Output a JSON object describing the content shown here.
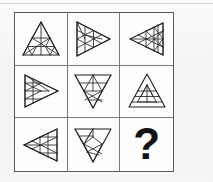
{
  "puzzle": {
    "type": "matrix-reasoning",
    "rows": 3,
    "columns": 3,
    "title": "Triangle pattern matrix",
    "missing_cell": "row-3-col-3",
    "missing_marker": "?",
    "stroke_color": "#1d1d1d",
    "grid_border_color": "#5a5a5a",
    "background_color": "#f7f7f7",
    "cells": [
      {
        "id": "cell-r1c1",
        "position": "row-1-col-1",
        "shape": "triangle",
        "orientation": "up",
        "description": "Upward triangle with internal lines",
        "content_label": "triangle-up-pattern-1"
      },
      {
        "id": "cell-r1c2",
        "position": "row-1-col-2",
        "shape": "triangle",
        "orientation": "right",
        "description": "Right-pointing triangle with internal lines",
        "content_label": "triangle-right-pattern-1"
      },
      {
        "id": "cell-r1c3",
        "position": "row-1-col-3",
        "shape": "triangle",
        "orientation": "left",
        "description": "Left-pointing triangle with internal lines",
        "content_label": "triangle-left-pattern-1"
      },
      {
        "id": "cell-r2c1",
        "position": "row-2-col-1",
        "shape": "triangle",
        "orientation": "right",
        "description": "Right-pointing triangle with internal lines",
        "content_label": "triangle-right-pattern-2"
      },
      {
        "id": "cell-r2c2",
        "position": "row-2-col-2",
        "shape": "triangle",
        "orientation": "down",
        "description": "Downward triangle with internal lines",
        "content_label": "triangle-down-pattern-1"
      },
      {
        "id": "cell-r2c3",
        "position": "row-2-col-3",
        "shape": "triangle",
        "orientation": "up",
        "description": "Upward triangle with horizontal internal lines",
        "content_label": "triangle-up-pattern-2"
      },
      {
        "id": "cell-r3c1",
        "position": "row-3-col-1",
        "shape": "triangle",
        "orientation": "left",
        "description": "Left-pointing triangle with internal lines",
        "content_label": "triangle-left-pattern-2"
      },
      {
        "id": "cell-r3c2",
        "position": "row-3-col-2",
        "shape": "triangle",
        "orientation": "down",
        "description": "Downward triangle with internal lines",
        "content_label": "triangle-down-pattern-2"
      },
      {
        "id": "cell-r3c3",
        "position": "row-3-col-3",
        "shape": "question-mark",
        "orientation": "none",
        "description": "Missing element marked with a question mark",
        "content_label": "?"
      }
    ]
  }
}
